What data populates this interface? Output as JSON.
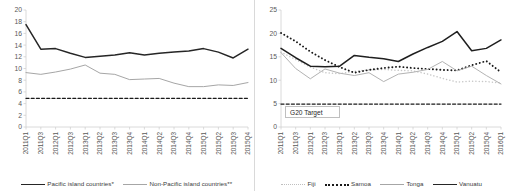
{
  "chart_data": [
    {
      "type": "line",
      "panel": "left",
      "title": "",
      "xlabel": "",
      "ylabel": "",
      "ylim": [
        0,
        20
      ],
      "ytick_step": 2,
      "yticks": [
        "0",
        "2",
        "4",
        "6",
        "8",
        "10",
        "12",
        "14",
        "16",
        "18",
        "20"
      ],
      "grid": false,
      "legend_position": "bottom",
      "categories": [
        "2011Q1",
        "2011Q3",
        "2012Q1",
        "2012Q3",
        "2013Q1",
        "2013Q2",
        "2013Q3",
        "2013Q4",
        "2014Q1",
        "2014Q2",
        "2014Q3",
        "2014Q4",
        "2015Q1",
        "2015Q2",
        "2015Q3",
        "2015Q4"
      ],
      "series": [
        {
          "name": "Pacific island countries*",
          "style": "solid",
          "color": "#262626",
          "values": [
            17.5,
            13.3,
            13.4,
            12.6,
            11.9,
            12.1,
            12.3,
            12.7,
            12.3,
            12.6,
            12.8,
            13.0,
            13.4,
            12.8,
            11.8,
            13.3
          ]
        },
        {
          "name": "Non-Pacific island countries**",
          "style": "solid",
          "color": "#a6a6a6",
          "values": [
            9.3,
            9.0,
            9.4,
            9.9,
            10.6,
            9.2,
            9.0,
            8.1,
            8.2,
            8.3,
            7.5,
            6.9,
            6.9,
            7.2,
            7.1,
            7.6
          ]
        },
        {
          "name": "G20 Target",
          "style": "dashed",
          "color": "#1a1a1a",
          "values": [
            4.9,
            4.9,
            4.9,
            4.9,
            4.9,
            4.9,
            4.9,
            4.9,
            4.9,
            4.9,
            4.9,
            4.9,
            4.9,
            4.9,
            4.9,
            4.9
          ]
        }
      ],
      "legend": [
        {
          "label": "Pacific island countries*",
          "swatch": "sw-solid-dark"
        },
        {
          "label": "Non-Pacific island countries**",
          "swatch": "sw-solid-light"
        }
      ]
    },
    {
      "type": "line",
      "panel": "right",
      "title": "",
      "xlabel": "",
      "ylabel": "",
      "ylim": [
        0,
        25
      ],
      "ytick_step": 5,
      "yticks": [
        "0",
        "5",
        "10",
        "15",
        "20",
        "25"
      ],
      "grid": false,
      "legend_position": "bottom",
      "annotation": "G20 Target",
      "categories": [
        "2011Q1",
        "2011Q3",
        "2012Q1",
        "2012Q3",
        "2013Q1",
        "2013Q2",
        "2013Q3",
        "2013Q4",
        "2014Q1",
        "2014Q2",
        "2014Q3",
        "2014Q4",
        "2015Q1",
        "2015Q2",
        "2015Q4",
        "2016Q1"
      ],
      "series": [
        {
          "name": "Fiji",
          "style": "dotted",
          "color": "#c8c8c8",
          "values": [
            16.0,
            14.4,
            12.8,
            11.6,
            11.4,
            11.9,
            12.2,
            12.3,
            12.1,
            12.0,
            11.3,
            10.4,
            9.6,
            9.8,
            9.7,
            9.4
          ]
        },
        {
          "name": "Samoa",
          "style": "dotted-bold",
          "color": "#1a1a1a",
          "values": [
            20.1,
            18.3,
            16.1,
            14.3,
            12.8,
            11.6,
            12.2,
            12.6,
            12.9,
            12.6,
            12.4,
            12.2,
            12.1,
            13.2,
            14.1,
            11.7
          ]
        },
        {
          "name": "Tonga",
          "style": "solid",
          "color": "#b3b3b3",
          "values": [
            15.9,
            12.5,
            10.3,
            12.4,
            11.5,
            11.0,
            11.6,
            9.7,
            11.3,
            11.7,
            12.3,
            14.0,
            12.0,
            13.0,
            11.0,
            9.2
          ]
        },
        {
          "name": "Vanuatu",
          "style": "solid-bold",
          "color": "#1f1f1f",
          "values": [
            16.8,
            14.8,
            13.0,
            12.9,
            13.0,
            15.3,
            14.9,
            14.6,
            14.0,
            15.6,
            17.0,
            18.3,
            20.4,
            16.3,
            16.8,
            18.6
          ]
        },
        {
          "name": "G20 Target",
          "style": "dashed",
          "color": "#1a1a1a",
          "values": [
            4.9,
            4.9,
            4.9,
            4.9,
            4.9,
            4.9,
            4.9,
            4.9,
            4.9,
            4.9,
            4.9,
            4.9,
            4.9,
            4.9,
            4.9,
            4.9
          ]
        }
      ],
      "legend": [
        {
          "label": "Fiji",
          "swatch": "sw-dot-light"
        },
        {
          "label": "Samoa",
          "swatch": "sw-dot-dark"
        },
        {
          "label": "Tonga",
          "swatch": "sw-solid-light"
        },
        {
          "label": "Vanuatu",
          "swatch": "sw-solid-dark"
        }
      ]
    }
  ]
}
